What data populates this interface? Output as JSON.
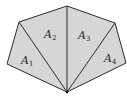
{
  "diagram": {
    "colors": {
      "fill": "#d6d6d6",
      "stroke": "#2b2b2b",
      "background": "#ffffff"
    },
    "vertices": {
      "left": [
        7,
        64
      ],
      "upper_left": [
        19,
        22
      ],
      "top": [
        67,
        6
      ],
      "upper_right": [
        115,
        23
      ],
      "right": [
        126,
        63
      ],
      "bottom": [
        67,
        92
      ]
    },
    "triangles": [
      {
        "id": "A1",
        "letter": "A",
        "subscript": "1",
        "label_pos": [
          21,
          55
        ]
      },
      {
        "id": "A2",
        "letter": "A",
        "subscript": "2",
        "label_pos": [
          44,
          29
        ]
      },
      {
        "id": "A3",
        "letter": "A",
        "subscript": "3",
        "label_pos": [
          78,
          30
        ]
      },
      {
        "id": "A4",
        "letter": "A",
        "subscript": "4",
        "label_pos": [
          104,
          53
        ]
      }
    ]
  }
}
